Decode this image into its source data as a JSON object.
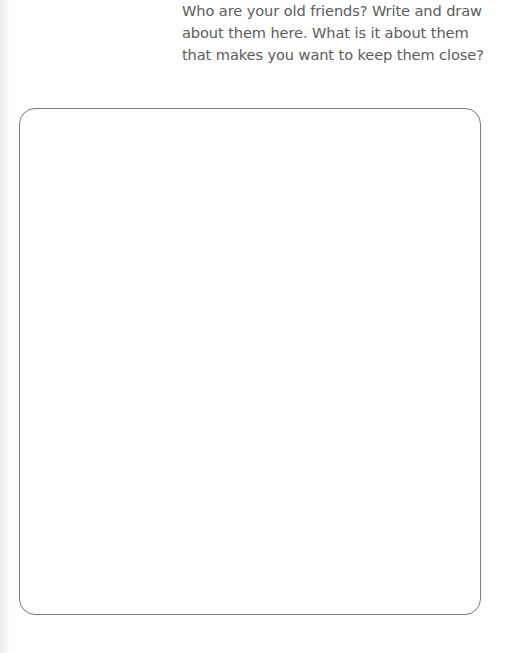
{
  "page": {
    "prompt_lines": [
      "Who are your old friends? Write and draw",
      "about them here. What is it about them",
      "that makes you want to keep them close?"
    ],
    "drawing_area": {
      "content": ""
    }
  },
  "colors": {
    "text": "#5b5b5b",
    "box_border": "#7a7a7a",
    "background": "#ffffff"
  }
}
